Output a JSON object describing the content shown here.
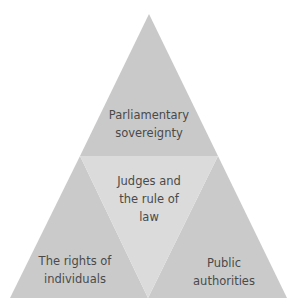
{
  "diagram": {
    "title": "",
    "colors": {
      "top": "#c9c9c9",
      "center": "#dbdbdb",
      "left": "#cacaca",
      "right": "#cacaca",
      "text": "#4a4a4a",
      "background": "#ffffff"
    },
    "segments": [
      {
        "id": "top",
        "label": "Parliamentary\nsovereignty"
      },
      {
        "id": "center",
        "label": "Judges and\nthe rule of\nlaw"
      },
      {
        "id": "left",
        "label": "The rights of\nindividuals"
      },
      {
        "id": "right",
        "label": "Public\nauthorities"
      }
    ]
  }
}
